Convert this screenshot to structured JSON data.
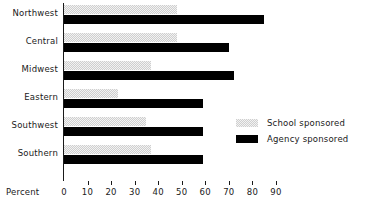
{
  "chart_data": {
    "type": "bar",
    "orientation": "horizontal",
    "title": "",
    "xlabel": "Percent",
    "ylabel": "",
    "xlim": [
      0,
      90
    ],
    "xticks": [
      0,
      10,
      20,
      30,
      40,
      50,
      60,
      70,
      80,
      90
    ],
    "xtick_labels": [
      "0",
      "10",
      "20",
      "30",
      "40",
      "50",
      "60",
      "70",
      "80",
      "90"
    ],
    "grid": false,
    "legend_position": "center-right",
    "categories": [
      "Northwest",
      "Central",
      "Midwest",
      "Eastern",
      "Southwest",
      "Southern"
    ],
    "series": [
      {
        "name": "School sponsored",
        "color": "#cfcfcf",
        "pattern": "light-checker",
        "values": [
          48,
          48,
          37,
          23,
          35,
          37
        ]
      },
      {
        "name": "Agency sponsored",
        "color": "#000000",
        "pattern": "solid",
        "values": [
          85,
          70,
          72,
          59,
          59,
          59
        ]
      }
    ]
  },
  "axis": {
    "x_title": "Percent"
  },
  "legend": {
    "entries": [
      {
        "label": "School sponsored",
        "swatch": "school"
      },
      {
        "label": "Agency sponsored",
        "swatch": "agency"
      }
    ]
  }
}
